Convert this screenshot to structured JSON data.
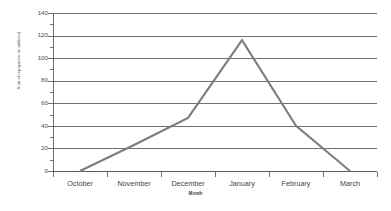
{
  "chart_data": {
    "type": "line",
    "title": "",
    "xlabel": "Month",
    "ylabel": "Sum of repayance (in millions)",
    "categories": [
      "October",
      "November",
      "December",
      "January",
      "February",
      "March"
    ],
    "series": [
      {
        "name": "Sum of repayance (in millions)",
        "values": [
          0,
          23,
          47,
          116,
          40,
          0
        ],
        "color": "#808080"
      }
    ],
    "ylim": [
      0,
      140
    ],
    "yticks": [
      0,
      20,
      40,
      60,
      80,
      100,
      120,
      140
    ],
    "ytick_labels": [
      "0",
      "20",
      "40",
      "60",
      "80",
      "100",
      "120",
      "140"
    ],
    "grid": true,
    "legend": "none",
    "line_color": "#7d7d7d",
    "grid_color": "#6e6e6e",
    "background": "#ffffff"
  },
  "axes": {
    "y_title": "Sum of repayance (in millions)",
    "x_title": "Month"
  }
}
